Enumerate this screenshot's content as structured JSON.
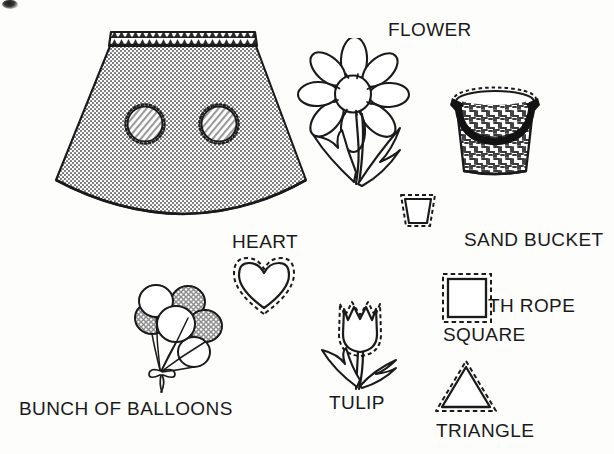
{
  "page": {
    "kind": "applique-pattern-sheet",
    "background_color": "#fdfdfc",
    "ink_color": "#1a1a1a",
    "width": 614,
    "height": 454
  },
  "labels": {
    "flower": "FLOWER",
    "sand_bucket_line1": "SAND BUCKET",
    "sand_bucket_line2": "WITH ROPE",
    "heart": "HEART",
    "bunch_of_balloons": "BUNCH OF BALLOONS",
    "tulip": "TULIP",
    "square": "SQUARE",
    "triangle": "TRIANGLE"
  },
  "figures": [
    {
      "name": "skirt-with-circle-appliques",
      "kind": "garment-illustration",
      "fill": "stippled-gray",
      "waistband": "dark-zigzag-band",
      "applique_count": 2,
      "applique_shape": "circle",
      "applique_fill": "diagonal-hatch"
    },
    {
      "name": "flower-daisy",
      "kind": "motif-illustration",
      "petal_count": 8,
      "leaf_count": 2,
      "fill": "white"
    },
    {
      "name": "sand-bucket-with-rope",
      "kind": "motif-illustration",
      "fill": "maze-texture",
      "handle": "dark-rope"
    },
    {
      "name": "bucket-template",
      "kind": "pattern-piece",
      "shape": "trapezoid",
      "seam_allowance": "dashed"
    },
    {
      "name": "heart-template",
      "kind": "pattern-piece",
      "shape": "heart",
      "seam_allowance": "dashed"
    },
    {
      "name": "bunch-of-balloons",
      "kind": "motif-illustration",
      "balloon_count": 6,
      "textured_balloons": 3,
      "tie": "bow"
    },
    {
      "name": "tulip",
      "kind": "motif-illustration",
      "leaf_count": 2,
      "seam_allowance": "dashed"
    },
    {
      "name": "square-template",
      "kind": "pattern-piece",
      "shape": "square",
      "seam_allowance": "dashed"
    },
    {
      "name": "triangle-template",
      "kind": "pattern-piece",
      "shape": "triangle",
      "seam_allowance": "dashed"
    }
  ]
}
